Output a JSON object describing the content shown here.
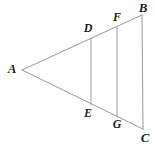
{
  "figure": {
    "width": 155,
    "height": 147,
    "background_color": "#ffffff",
    "line_color": "#9a9a9a",
    "line_width": 1,
    "label_color": "#231f20"
  },
  "labels": {
    "A": "A",
    "B": "B",
    "C": "C",
    "D": "D",
    "E": "E",
    "F": "F",
    "G": "G"
  },
  "geometry": {
    "points": {
      "A": {
        "x": 22,
        "y": 70
      },
      "B": {
        "x": 142,
        "y": 15
      },
      "C": {
        "x": 143,
        "y": 129
      },
      "D": {
        "x": 91,
        "y": 38
      },
      "E": {
        "x": 91,
        "y": 105
      },
      "F": {
        "x": 117,
        "y": 27
      },
      "G": {
        "x": 117,
        "y": 117
      }
    },
    "label_positions": {
      "A": {
        "x": 12,
        "y": 68
      },
      "B": {
        "x": 143,
        "y": 7
      },
      "C": {
        "x": 145,
        "y": 137
      },
      "D": {
        "x": 88,
        "y": 28
      },
      "E": {
        "x": 88,
        "y": 113
      },
      "F": {
        "x": 117,
        "y": 17
      },
      "G": {
        "x": 117,
        "y": 124
      }
    },
    "segments": [
      {
        "name": "AB",
        "from": "A",
        "to": "B"
      },
      {
        "name": "AC",
        "from": "A",
        "to": "C"
      },
      {
        "name": "BC",
        "from": "B",
        "to": "C"
      },
      {
        "name": "DE",
        "from": "D",
        "to": "E"
      },
      {
        "name": "FG",
        "from": "F",
        "to": "G"
      }
    ]
  }
}
